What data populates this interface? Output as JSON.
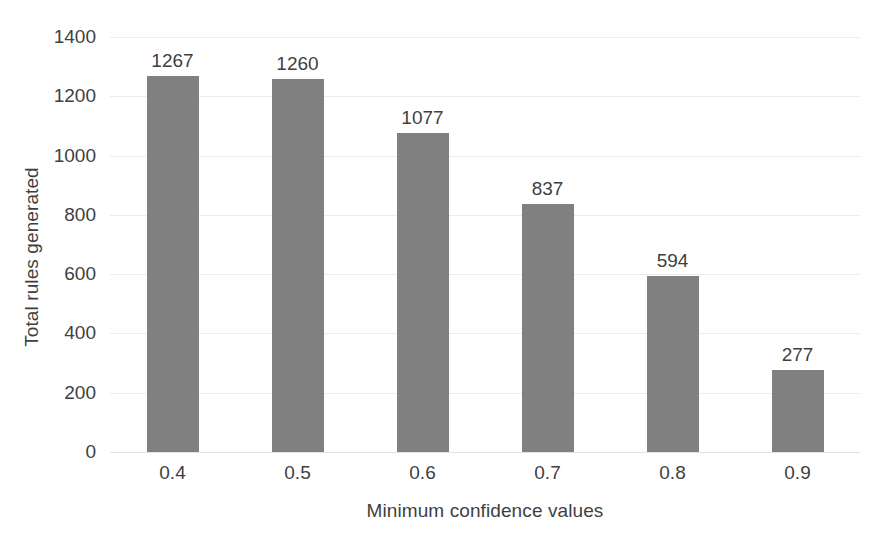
{
  "chart_data": {
    "type": "bar",
    "title": "",
    "categories": [
      "0.4",
      "0.5",
      "0.6",
      "0.7",
      "0.8",
      "0.9"
    ],
    "values": [
      1267,
      1260,
      1077,
      837,
      594,
      277
    ],
    "xlabel": "Minimum confidence values",
    "ylabel": "Total rules generated",
    "ylim": [
      0,
      1400
    ],
    "yticks": [
      0,
      200,
      400,
      600,
      800,
      1000,
      1200,
      1400
    ],
    "ytick_labels": [
      "0",
      "200",
      "400",
      "600",
      "800",
      "1000",
      "1200",
      "1400"
    ],
    "data_labels": [
      "1267",
      "1260",
      "1077",
      "837",
      "594",
      "277"
    ],
    "grid": true,
    "legend": false,
    "colors": {
      "bar": "#808080",
      "gridline": "#ececec",
      "text": "#3f3f3f",
      "background": "#ffffff"
    }
  }
}
